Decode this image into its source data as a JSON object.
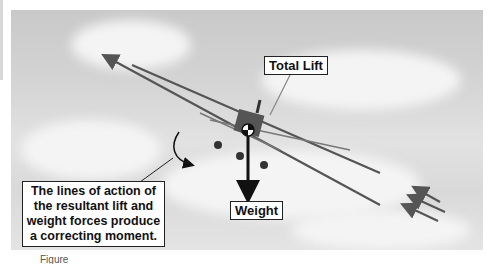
{
  "figure": {
    "labels": {
      "total_lift": "Total Lift",
      "weight": "Weight",
      "moment_note": "The lines of action of the resultant lift and weight forces produce a correcting moment."
    },
    "caption_partial": "Figure",
    "colors": {
      "sky": "#d4d4d4",
      "cloud": "#f4f4f4",
      "airflow_arrow": "#555555",
      "weight_arrow": "#111111",
      "label_border": "#222222"
    },
    "icons": [
      "airflow-arrow",
      "weight-arrow",
      "total-lift-pointer",
      "moment-arc-arrow",
      "airplane-front-view"
    ]
  }
}
